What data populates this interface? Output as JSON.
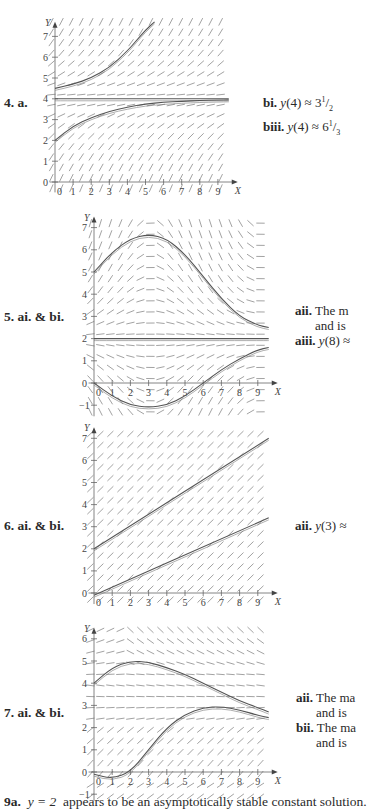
{
  "problems": [
    {
      "label": "4.  a.",
      "answers": [
        {
          "tag": "bi.",
          "text": "y(4) ≈ 3",
          "frac_num": "1",
          "frac_den": "2"
        },
        {
          "tag": "biii.",
          "text": "y(4) ≈ 6",
          "frac_num": "1",
          "frac_den": "3"
        }
      ]
    },
    {
      "label": "5.  ai. & bi.",
      "answers": [
        {
          "tag": "aii.",
          "text": "The m"
        },
        {
          "tag": "",
          "text": "and is"
        },
        {
          "tag": "aiii.",
          "text": "y(8) ≈"
        }
      ]
    },
    {
      "label": "6.  ai. & bi.",
      "answers": [
        {
          "tag": "aii.",
          "text": "y(3) ≈"
        }
      ]
    },
    {
      "label": "7.  ai. & bi.",
      "answers": [
        {
          "tag": "aii.",
          "text": "The ma"
        },
        {
          "tag": "",
          "text": "and is"
        },
        {
          "tag": "bii.",
          "text": "The ma"
        },
        {
          "tag": "",
          "text": "and is"
        }
      ]
    }
  ],
  "footer": {
    "tag": "9a.",
    "equation": "y = 2",
    "text": "appears to be an asymptotically stable constant solution."
  },
  "chart_data": [
    {
      "type": "line",
      "title": "Problem 4a direction field",
      "xlabel": "X",
      "ylabel": "Y",
      "xticks": [
        0,
        1,
        2,
        3,
        4,
        5,
        6,
        7,
        8,
        9
      ],
      "yticks": [
        0,
        1,
        2,
        3,
        4,
        5,
        6,
        7
      ],
      "xlim": [
        -0.3,
        9.6
      ],
      "ylim": [
        -0.5,
        7.7
      ],
      "slope_field": true,
      "series": [
        {
          "name": "y=4 equilibrium",
          "x": [
            0,
            9.6
          ],
          "y": [
            4,
            4
          ]
        },
        {
          "name": "upper solution",
          "x": [
            0,
            1,
            2,
            3,
            4,
            4.5,
            5,
            5.5
          ],
          "y": [
            4.5,
            4.7,
            5.0,
            5.5,
            6.3,
            6.8,
            7.3,
            7.7
          ]
        },
        {
          "name": "lower solution",
          "x": [
            0,
            1,
            2,
            3,
            4,
            5,
            6,
            7,
            8,
            9,
            9.6
          ],
          "y": [
            2.0,
            2.7,
            3.1,
            3.4,
            3.6,
            3.75,
            3.83,
            3.88,
            3.92,
            3.94,
            3.95
          ]
        }
      ]
    },
    {
      "type": "line",
      "title": "Problem 5 direction field",
      "xlabel": "X",
      "ylabel": "Y",
      "xticks": [
        0,
        1,
        2,
        3,
        4,
        5,
        6,
        7,
        8,
        9
      ],
      "yticks": [
        -1,
        0,
        1,
        2,
        3,
        4,
        5,
        6,
        7
      ],
      "xlim": [
        -0.3,
        9.6
      ],
      "ylim": [
        -1.5,
        7.5
      ],
      "slope_field": true,
      "series": [
        {
          "name": "y=2 equilibrium",
          "x": [
            0,
            9.6
          ],
          "y": [
            2,
            2
          ]
        },
        {
          "name": "upper solution",
          "x": [
            0,
            1,
            2,
            3,
            4,
            5,
            6,
            7,
            8,
            9,
            9.6
          ],
          "y": [
            5.0,
            5.9,
            6.5,
            6.7,
            6.5,
            5.8,
            4.8,
            3.8,
            3.0,
            2.6,
            2.5
          ]
        },
        {
          "name": "lower solution",
          "x": [
            0,
            1,
            2,
            3,
            4,
            5,
            6,
            7,
            8,
            9,
            9.6
          ],
          "y": [
            0.0,
            -0.6,
            -1.0,
            -1.1,
            -1.0,
            -0.6,
            0.0,
            0.6,
            1.1,
            1.5,
            1.6
          ]
        }
      ]
    },
    {
      "type": "line",
      "title": "Problem 6 direction field",
      "xlabel": "X",
      "ylabel": "Y",
      "xticks": [
        0,
        1,
        2,
        3,
        4,
        5,
        6,
        7,
        8,
        9
      ],
      "yticks": [
        0,
        1,
        2,
        3,
        4,
        5,
        6,
        7
      ],
      "xlim": [
        -0.3,
        9.6
      ],
      "ylim": [
        -0.5,
        7.5
      ],
      "slope_field": true,
      "series": [
        {
          "name": "upper solution",
          "x": [
            0,
            9.6
          ],
          "y": [
            2.0,
            7.0
          ]
        },
        {
          "name": "lower solution",
          "x": [
            0,
            9.6
          ],
          "y": [
            -0.1,
            3.4
          ]
        }
      ]
    },
    {
      "type": "line",
      "title": "Problem 7 direction field",
      "xlabel": "X",
      "ylabel": "Y",
      "xticks": [
        0,
        1,
        2,
        3,
        4,
        5,
        6,
        7,
        8,
        9
      ],
      "yticks": [
        -1,
        0,
        1,
        2,
        3,
        4,
        5,
        6
      ],
      "xlim": [
        -0.3,
        9.6
      ],
      "ylim": [
        -1.3,
        6.5
      ],
      "slope_field": true,
      "series": [
        {
          "name": "upper solution",
          "x": [
            0,
            1,
            2,
            3,
            4,
            5,
            6,
            7,
            8,
            9,
            9.6
          ],
          "y": [
            4.0,
            4.7,
            5.0,
            4.95,
            4.7,
            4.4,
            4.0,
            3.6,
            3.2,
            2.9,
            2.7
          ]
        },
        {
          "name": "lower solution",
          "x": [
            0,
            1,
            2,
            3,
            4,
            5,
            6,
            7,
            8,
            9,
            9.6
          ],
          "y": [
            -0.1,
            -0.3,
            0.0,
            1.0,
            2.0,
            2.6,
            2.9,
            2.95,
            2.8,
            2.55,
            2.45
          ]
        }
      ]
    }
  ]
}
